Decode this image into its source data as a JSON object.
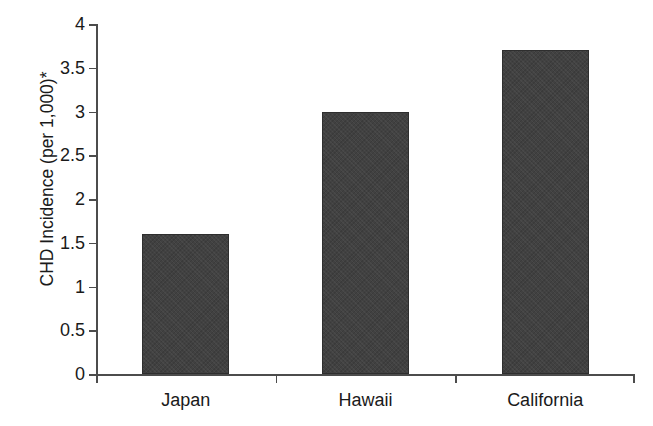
{
  "chart_data": {
    "type": "bar",
    "title": "",
    "subtitle": "",
    "xlabel": "",
    "ylabel": "CHD Incidence (per 1,000)*",
    "categories": [
      "Japan",
      "Hawaii",
      "California"
    ],
    "values": [
      1.6,
      3.0,
      3.7
    ],
    "series": [
      {
        "name": "CHD Incidence",
        "values": [
          1.6,
          3.0,
          3.7
        ]
      }
    ],
    "ylim": [
      0,
      4
    ],
    "xlim": [
      0,
      3
    ],
    "ytick_labels": [
      "0",
      "0.5",
      "1",
      "1.5",
      "2",
      "2.5",
      "3",
      "3.5",
      "4"
    ],
    "ytick_values": [
      0,
      0.5,
      1,
      1.5,
      2,
      2.5,
      3,
      3.5,
      4
    ],
    "ytick_interval": 0.5,
    "grid": false,
    "legend": false,
    "legend_position": "none",
    "annotations": [],
    "bar_color": "#414141",
    "bar_edge_color": "#2e2e2e",
    "axis_color": "#4c4c4c",
    "background_color": "#ffffff"
  }
}
